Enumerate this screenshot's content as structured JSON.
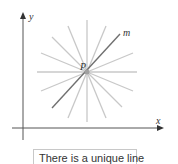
{
  "diagram": {
    "axes": {
      "x_label": "x",
      "y_label": "y"
    },
    "point": {
      "label": "P",
      "cx": 87,
      "cy": 72
    },
    "line_m": {
      "label": "m",
      "color": "#707070"
    },
    "pencil_lines": {
      "count": 8,
      "radius": 50,
      "color": "#c8c8c8"
    },
    "axis_color": "#555555"
  },
  "caption": {
    "text": "There is a unique line"
  }
}
